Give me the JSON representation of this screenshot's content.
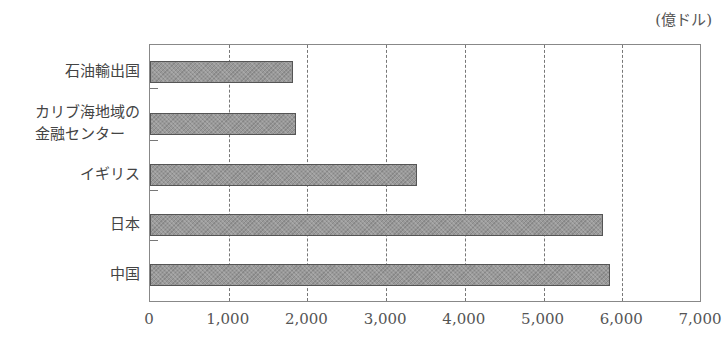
{
  "chart_data": {
    "type": "bar",
    "orientation": "horizontal",
    "title": "",
    "unit_label": "(億ドル)",
    "xlabel": "",
    "ylabel": "",
    "xlim": [
      0,
      7000
    ],
    "grid": "vertical dashed",
    "categories": [
      "石油輸出国",
      "カリブ海地域の\n金融センター",
      "イギリス",
      "日本",
      "中国"
    ],
    "category_lines": [
      [
        "石油輸出国"
      ],
      [
        "カリブ海地域の",
        "金融センター"
      ],
      [
        "イギリス"
      ],
      [
        "日本"
      ],
      [
        "中国"
      ]
    ],
    "values": [
      1820,
      1850,
      3390,
      5750,
      5850
    ],
    "x_ticks": [
      0,
      1000,
      2000,
      3000,
      4000,
      5000,
      6000,
      7000
    ],
    "x_tick_labels": [
      "0",
      "1,000",
      "2,000",
      "3,000",
      "4,000",
      "5,000",
      "6,000",
      "7,000"
    ],
    "bar_color": "#999999"
  }
}
